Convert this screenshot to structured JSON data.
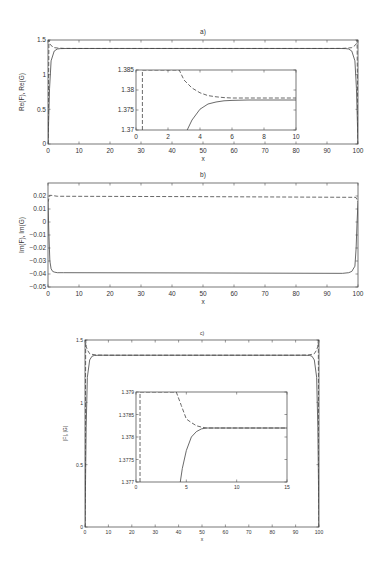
{
  "chart_data": [
    {
      "type": "line",
      "title": "a)",
      "xlabel": "x",
      "ylabel": "Re(F), Re(G)",
      "xlim": [
        0,
        100
      ],
      "ylim": [
        0,
        1.5
      ],
      "xticks": [
        "0",
        "10",
        "20",
        "30",
        "40",
        "50",
        "60",
        "70",
        "80",
        "90",
        "100"
      ],
      "yticks": [
        "0",
        "0.5",
        "1",
        "1.5"
      ],
      "series": [
        {
          "name": "Re(F)",
          "style": "solid",
          "x": [
            0,
            0.5,
            1,
            2,
            3,
            4,
            6,
            10,
            50,
            90,
            94,
            96,
            97,
            98,
            99,
            99.5,
            100
          ],
          "y": [
            0,
            0.8,
            1.2,
            1.34,
            1.37,
            1.376,
            1.3775,
            1.3775,
            1.3775,
            1.3775,
            1.3775,
            1.376,
            1.37,
            1.34,
            1.2,
            0.8,
            0
          ]
        },
        {
          "name": "Re(G)",
          "style": "dashed",
          "x": [
            0,
            0.3,
            0.5,
            1,
            2,
            3,
            5,
            10,
            50,
            90,
            95,
            97,
            98,
            99,
            99.5,
            99.7,
            100
          ],
          "y": [
            0,
            1.5,
            1.45,
            1.42,
            1.39,
            1.385,
            1.379,
            1.378,
            1.378,
            1.378,
            1.379,
            1.385,
            1.39,
            1.42,
            1.45,
            1.5,
            0
          ]
        }
      ],
      "inset": {
        "xlim": [
          0,
          10
        ],
        "ylim": [
          1.37,
          1.385
        ],
        "xticks": [
          "0",
          "2",
          "4",
          "6",
          "8",
          "10"
        ],
        "yticks": [
          "1.37",
          "1.375",
          "1.38",
          "1.385"
        ],
        "series": [
          {
            "name": "Re(F)",
            "style": "solid",
            "x": [
              3.2,
              3.5,
              4,
              4.5,
              5,
              5.5,
              6,
              7,
              8,
              10
            ],
            "y": [
              1.37,
              1.3725,
              1.3752,
              1.3765,
              1.377,
              1.3773,
              1.3774,
              1.3775,
              1.3775,
              1.3775
            ]
          },
          {
            "name": "Re(G)",
            "style": "dashed",
            "x": [
              0.4,
              0.4,
              2.7,
              3,
              3.5,
              4,
              4.5,
              5,
              5.5,
              6,
              7,
              8,
              10
            ],
            "y": [
              1.37,
              1.385,
              1.385,
              1.3825,
              1.3805,
              1.3793,
              1.3786,
              1.3783,
              1.3781,
              1.378,
              1.378,
              1.378,
              1.378
            ]
          }
        ]
      }
    },
    {
      "type": "line",
      "title": "b)",
      "xlabel": "x",
      "ylabel": "Im(F), Im(G)",
      "xlim": [
        0,
        100
      ],
      "ylim": [
        -0.05,
        0.03
      ],
      "xticks": [
        "0",
        "10",
        "20",
        "30",
        "40",
        "50",
        "60",
        "70",
        "80",
        "90",
        "100"
      ],
      "yticks": [
        "-0.05",
        "-0.04",
        "-0.03",
        "-0.02",
        "-0.01",
        "0",
        "0.01",
        "0.02"
      ],
      "series": [
        {
          "name": "Im(F)",
          "style": "solid",
          "x": [
            0,
            0.3,
            0.6,
            1,
            1.5,
            2,
            3,
            5,
            50,
            95,
            97,
            98,
            99,
            99.4,
            99.7,
            100
          ],
          "y": [
            0.015,
            -0.01,
            -0.03,
            -0.036,
            -0.038,
            -0.0385,
            -0.039,
            -0.039,
            -0.0392,
            -0.0395,
            -0.039,
            -0.038,
            -0.034,
            -0.02,
            0.0,
            0.015
          ]
        },
        {
          "name": "Im(G)",
          "style": "dashed",
          "x": [
            0,
            0.5,
            1,
            3,
            50,
            97,
            99,
            99.5,
            100
          ],
          "y": [
            0.015,
            0.0205,
            0.0205,
            0.0198,
            0.0195,
            0.019,
            0.019,
            0.0185,
            0.015
          ]
        }
      ]
    },
    {
      "type": "line",
      "title": "c)",
      "xlabel": "x",
      "ylabel": "|F|, |G|",
      "xlim": [
        0,
        100
      ],
      "ylim": [
        0,
        1.5
      ],
      "xticks": [
        "0",
        "10",
        "20",
        "30",
        "40",
        "50",
        "60",
        "70",
        "80",
        "90",
        "100"
      ],
      "yticks": [
        "0",
        "0.5",
        "1",
        "1.5"
      ],
      "series": [
        {
          "name": "|F|",
          "style": "solid",
          "x": [
            0,
            0.5,
            1,
            2,
            3,
            4,
            6,
            10,
            50,
            90,
            94,
            96,
            97,
            98,
            99,
            99.5,
            100
          ],
          "y": [
            0,
            0.8,
            1.2,
            1.34,
            1.37,
            1.376,
            1.378,
            1.378,
            1.378,
            1.378,
            1.378,
            1.376,
            1.37,
            1.34,
            1.2,
            0.8,
            0
          ]
        },
        {
          "name": "|G|",
          "style": "dashed",
          "x": [
            0,
            0.3,
            0.5,
            1,
            2,
            3,
            5,
            10,
            50,
            90,
            95,
            97,
            98,
            99,
            99.5,
            99.7,
            100
          ],
          "y": [
            0,
            1.5,
            1.45,
            1.42,
            1.39,
            1.385,
            1.379,
            1.378,
            1.378,
            1.378,
            1.379,
            1.385,
            1.39,
            1.42,
            1.45,
            1.5,
            0
          ]
        }
      ],
      "inset": {
        "xlim": [
          0,
          15
        ],
        "ylim": [
          1.377,
          1.379
        ],
        "xticks": [
          "0",
          "5",
          "10",
          "15"
        ],
        "yticks": [
          "1.377",
          "1.3775",
          "1.378",
          "1.3785",
          "1.379"
        ],
        "series": [
          {
            "name": "|F|",
            "style": "solid",
            "x": [
              4.4,
              4.6,
              5,
              5.5,
              6,
              6.5,
              7,
              8,
              10,
              15
            ],
            "y": [
              1.377,
              1.3773,
              1.3777,
              1.378,
              1.37812,
              1.37818,
              1.3782,
              1.3782,
              1.3782,
              1.3782
            ]
          },
          {
            "name": "|G|",
            "style": "dashed",
            "x": [
              0.4,
              0.4,
              4,
              4.5,
              5,
              5.5,
              6,
              6.5,
              7,
              8,
              10,
              15
            ],
            "y": [
              1.377,
              1.379,
              1.379,
              1.3787,
              1.3784,
              1.37832,
              1.37825,
              1.37822,
              1.3782,
              1.3782,
              1.3782,
              1.3782
            ]
          }
        ]
      }
    }
  ]
}
